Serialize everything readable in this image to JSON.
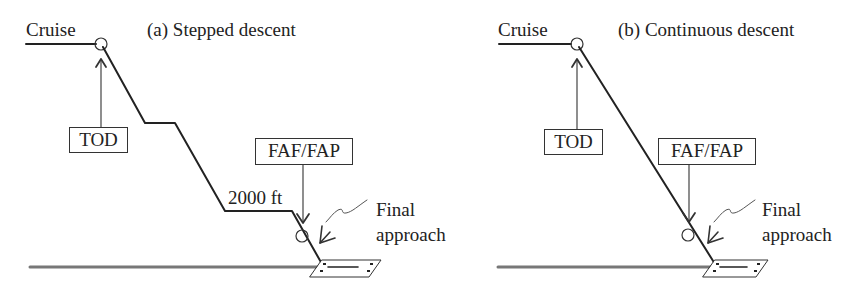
{
  "panels": [
    {
      "id": "a",
      "title": "(a) Stepped descent",
      "cruise_label": "Cruise",
      "tod_label": "TOD",
      "faf_label": "FAF/FAP",
      "altitude_label": "2000 ft",
      "final_approach_label_line1": "Final",
      "final_approach_label_line2": "approach"
    },
    {
      "id": "b",
      "title": "(b) Continuous descent",
      "cruise_label": "Cruise",
      "tod_label": "TOD",
      "faf_label": "FAF/FAP",
      "final_approach_label_line1": "Final",
      "final_approach_label_line2": "approach"
    }
  ],
  "colors": {
    "line": "#222222",
    "ground": "#777777",
    "arrow": "#444444"
  }
}
